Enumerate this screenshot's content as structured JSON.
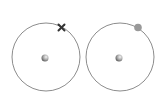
{
  "diagram": {
    "atoms": [
      {
        "name": "atom-left",
        "electron_symbol": "cross",
        "cx": 46,
        "cy": 57,
        "r": 34
      },
      {
        "name": "atom-right",
        "electron_symbol": "dot",
        "cx": 120,
        "cy": 57,
        "r": 34
      }
    ],
    "colors": {
      "orbit": "#6e6e6e",
      "cross": "#333333",
      "dot": "#999999",
      "nucleus_light": "#f2f2f2",
      "nucleus_dark": "#6a6a6a"
    }
  }
}
